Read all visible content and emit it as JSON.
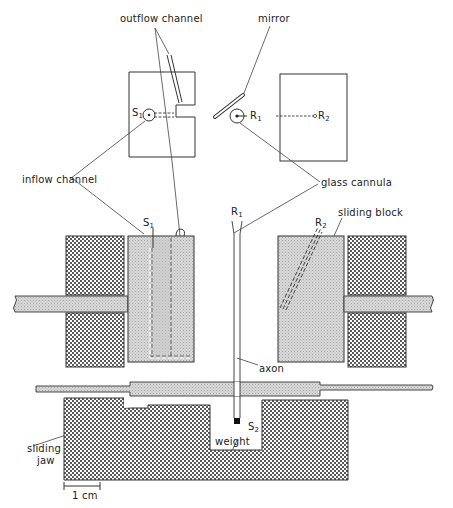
{
  "diagram": {
    "type": "apparatus schematic",
    "top_view": {
      "left_block": {
        "label_S": "S",
        "label_S_sub": "1"
      },
      "right_block": {
        "label_R1": "R",
        "label_R1_sub": "1",
        "label_R2": "R",
        "label_R2_sub": "2"
      }
    },
    "labels": {
      "outflow_channel": "outflow channel",
      "mirror": "mirror",
      "inflow_channel": "inflow channel",
      "glass_cannula": "glass cannula",
      "sliding_block": "sliding block",
      "axon": "axon",
      "weight": "weight",
      "sliding_jaw_line1": "sliding",
      "sliding_jaw_line2": "jaw",
      "S1": "S",
      "S1_sub": "1",
      "R1": "R",
      "R1_sub": "1",
      "R2": "R",
      "R2_sub": "2",
      "S2": "S",
      "S2_sub": "2"
    },
    "scale_bar": {
      "label": "1 cm"
    },
    "colors": {
      "line": "#333333",
      "light_fill": "#d4d4d4",
      "dark_hatch": "#6a6a6a",
      "background": "#ffffff"
    }
  }
}
